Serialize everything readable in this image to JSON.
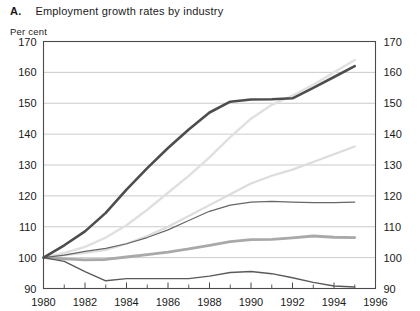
{
  "figure": {
    "label": "A.",
    "title": "Employment growth rates by industry",
    "unit_label": "Per cent"
  },
  "chart_data": {
    "type": "line",
    "title": "Employment growth rates by industry",
    "subtitle": "",
    "xlabel": "",
    "ylabel": "Per cent",
    "xlim": [
      1980,
      1996
    ],
    "ylim": [
      90,
      170
    ],
    "ytick_values": [
      90,
      100,
      110,
      120,
      130,
      140,
      150,
      160,
      170
    ],
    "ytick_labels": [
      "90",
      "100",
      "110",
      "120",
      "130",
      "140",
      "150",
      "160",
      "170"
    ],
    "xtick_values": [
      1980,
      1982,
      1984,
      1986,
      1988,
      1990,
      1992,
      1994,
      1996
    ],
    "xtick_labels": [
      "1980",
      "1982",
      "1984",
      "1986",
      "1988",
      "1990",
      "1992",
      "1994",
      "1996"
    ],
    "x_minor_ticks": [
      1981,
      1983,
      1985,
      1987,
      1989,
      1991,
      1993,
      1995
    ],
    "grid": "horizontal",
    "grid_color": "#b4b4b4",
    "legend": "none",
    "axes_mirrored": true,
    "x": [
      1980,
      1981,
      1982,
      1983,
      1984,
      1985,
      1986,
      1987,
      1988,
      1989,
      1990,
      1991,
      1992,
      1993,
      1994,
      1995
    ],
    "series": [
      {
        "name": "series-1-dark",
        "color": "#4d4d4d",
        "width": 2.6,
        "values": [
          100.0,
          104.0,
          108.5,
          114.5,
          122.0,
          129.0,
          135.5,
          141.5,
          147.0,
          150.5,
          151.2,
          151.3,
          151.6,
          155.0,
          158.5,
          162.0
        ]
      },
      {
        "name": "series-2-lightest",
        "color": "#e0e0e0",
        "width": 2.4,
        "values": [
          100.0,
          101.5,
          103.5,
          106.5,
          110.5,
          115.5,
          121.0,
          126.5,
          132.5,
          139.0,
          145.0,
          149.5,
          152.5,
          156.0,
          160.0,
          164.0
        ]
      },
      {
        "name": "series-3-light",
        "color": "#dcdcdc",
        "width": 2.2,
        "values": [
          100.0,
          100.8,
          101.5,
          102.5,
          104.5,
          107.0,
          110.0,
          113.5,
          117.0,
          120.5,
          124.0,
          126.5,
          128.5,
          131.0,
          133.5,
          136.0
        ]
      },
      {
        "name": "series-4-thin-dark",
        "color": "#666666",
        "width": 1.2,
        "values": [
          100.0,
          100.8,
          102.0,
          103.0,
          104.5,
          106.5,
          109.0,
          112.0,
          115.0,
          117.0,
          118.0,
          118.2,
          118.0,
          117.8,
          117.8,
          118.0
        ]
      },
      {
        "name": "series-5-medium-grey",
        "color": "#a9a9a9",
        "width": 2.8,
        "values": [
          100.0,
          99.6,
          99.3,
          99.4,
          100.2,
          101.0,
          101.8,
          102.8,
          104.0,
          105.2,
          105.8,
          105.9,
          106.4,
          107.0,
          106.6,
          106.5
        ]
      },
      {
        "name": "series-6-declining",
        "color": "#5a5a5a",
        "width": 1.4,
        "values": [
          100.0,
          98.8,
          95.5,
          92.5,
          93.2,
          93.2,
          93.2,
          93.2,
          94.0,
          95.2,
          95.5,
          94.8,
          93.5,
          92.0,
          90.8,
          90.5
        ]
      }
    ]
  }
}
